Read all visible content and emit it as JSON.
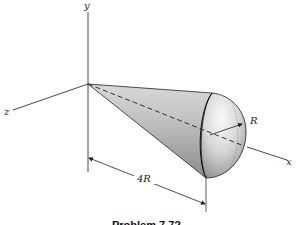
{
  "figure": {
    "axes": {
      "x_label": "x",
      "y_label": "y",
      "z_label": "z"
    },
    "dimensions": {
      "length_label": "4R",
      "radius_label": "R"
    },
    "caption": "Problem 7.7?",
    "colors": {
      "line": "#222222",
      "surface_light": "#f2f2f2",
      "surface_dark": "#8a8a8a"
    }
  }
}
